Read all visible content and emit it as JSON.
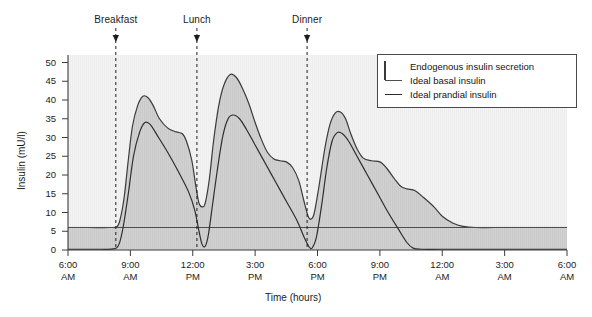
{
  "chart_data": {
    "type": "area",
    "title": "",
    "xlabel": "Time (hours)",
    "ylabel": "Insulin (mU/l)",
    "ylim": [
      0,
      52
    ],
    "yticks": [
      0,
      5,
      10,
      15,
      20,
      25,
      30,
      35,
      40,
      45,
      50
    ],
    "xlim_hours": [
      6,
      30
    ],
    "grid": false,
    "legend_position": "top-right",
    "xticks": [
      {
        "hour": 6,
        "time": "6:00",
        "ampm": "AM"
      },
      {
        "hour": 9,
        "time": "9:00",
        "ampm": "AM"
      },
      {
        "hour": 12,
        "time": "12:00",
        "ampm": "PM"
      },
      {
        "hour": 15,
        "time": "3:00",
        "ampm": "PM"
      },
      {
        "hour": 18,
        "time": "6:00",
        "ampm": "PM"
      },
      {
        "hour": 21,
        "time": "9:00",
        "ampm": "PM"
      },
      {
        "hour": 24,
        "time": "12:00",
        "ampm": "AM"
      },
      {
        "hour": 27,
        "time": "3:00",
        "ampm": "AM"
      },
      {
        "hour": 30,
        "time": "6:00",
        "ampm": "AM"
      }
    ],
    "annotations": [
      {
        "label": "Breakfast",
        "hour": 8.3
      },
      {
        "label": "Lunch",
        "hour": 12.2
      },
      {
        "label": "Dinner",
        "hour": 17.5
      }
    ],
    "series": [
      {
        "name": "Endogenous insulin secretion",
        "kind": "area",
        "fill_color": "#d2d2d2",
        "line_color": "#3a3a3a",
        "points": [
          [
            6.0,
            6.0
          ],
          [
            7.0,
            6.0
          ],
          [
            8.0,
            6.0
          ],
          [
            8.35,
            6.2
          ],
          [
            8.5,
            8.0
          ],
          [
            8.7,
            14.0
          ],
          [
            8.9,
            24.0
          ],
          [
            9.1,
            33.0
          ],
          [
            9.35,
            38.5
          ],
          [
            9.6,
            41.0
          ],
          [
            9.85,
            40.6
          ],
          [
            10.1,
            38.5
          ],
          [
            10.4,
            35.0
          ],
          [
            10.8,
            32.5
          ],
          [
            11.2,
            31.5
          ],
          [
            11.5,
            31.0
          ],
          [
            11.7,
            29.0
          ],
          [
            11.95,
            24.0
          ],
          [
            12.15,
            17.0
          ],
          [
            12.3,
            12.5
          ],
          [
            12.45,
            11.5
          ],
          [
            12.6,
            12.5
          ],
          [
            12.8,
            19.0
          ],
          [
            13.0,
            29.0
          ],
          [
            13.25,
            38.5
          ],
          [
            13.5,
            44.0
          ],
          [
            13.8,
            46.8
          ],
          [
            14.1,
            46.0
          ],
          [
            14.4,
            43.0
          ],
          [
            14.7,
            39.0
          ],
          [
            15.0,
            34.0
          ],
          [
            15.3,
            29.5
          ],
          [
            15.6,
            26.0
          ],
          [
            15.9,
            24.3
          ],
          [
            16.2,
            23.8
          ],
          [
            16.5,
            23.5
          ],
          [
            16.8,
            22.0
          ],
          [
            17.1,
            18.5
          ],
          [
            17.35,
            13.0
          ],
          [
            17.55,
            9.0
          ],
          [
            17.7,
            8.3
          ],
          [
            17.85,
            10.0
          ],
          [
            18.1,
            18.0
          ],
          [
            18.35,
            27.0
          ],
          [
            18.6,
            33.5
          ],
          [
            18.85,
            36.5
          ],
          [
            19.1,
            36.8
          ],
          [
            19.35,
            35.0
          ],
          [
            19.6,
            31.0
          ],
          [
            19.9,
            27.0
          ],
          [
            20.2,
            24.5
          ],
          [
            20.6,
            23.8
          ],
          [
            21.0,
            23.5
          ],
          [
            21.3,
            22.0
          ],
          [
            21.7,
            19.0
          ],
          [
            22.0,
            17.0
          ],
          [
            22.3,
            16.3
          ],
          [
            22.7,
            15.8
          ],
          [
            23.1,
            14.0
          ],
          [
            23.6,
            11.5
          ],
          [
            24.0,
            9.0
          ],
          [
            24.5,
            7.2
          ],
          [
            25.0,
            6.3
          ],
          [
            25.6,
            6.0
          ],
          [
            26.5,
            6.0
          ],
          [
            28.0,
            6.0
          ],
          [
            30.0,
            6.0
          ]
        ]
      },
      {
        "name": "Ideal basal insulin",
        "kind": "line",
        "line_color": "#4d4d4d",
        "level": 6.0,
        "points": [
          [
            6.0,
            6.0
          ],
          [
            30.0,
            6.0
          ]
        ]
      },
      {
        "name": "Ideal prandial insulin",
        "kind": "line",
        "line_color": "#2e2e2e",
        "points": [
          [
            6.0,
            0.2
          ],
          [
            7.5,
            0.2
          ],
          [
            8.2,
            0.3
          ],
          [
            8.45,
            1.5
          ],
          [
            8.65,
            6.0
          ],
          [
            8.9,
            15.0
          ],
          [
            9.15,
            25.0
          ],
          [
            9.45,
            31.5
          ],
          [
            9.7,
            34.0
          ],
          [
            9.95,
            33.5
          ],
          [
            10.3,
            30.5
          ],
          [
            10.8,
            26.0
          ],
          [
            11.3,
            21.0
          ],
          [
            11.8,
            15.5
          ],
          [
            12.1,
            10.5
          ],
          [
            12.3,
            5.0
          ],
          [
            12.45,
            1.5
          ],
          [
            12.6,
            1.0
          ],
          [
            12.75,
            4.0
          ],
          [
            12.95,
            12.0
          ],
          [
            13.2,
            22.0
          ],
          [
            13.45,
            30.5
          ],
          [
            13.7,
            35.0
          ],
          [
            13.95,
            36.0
          ],
          [
            14.25,
            35.0
          ],
          [
            14.6,
            32.0
          ],
          [
            15.0,
            28.0
          ],
          [
            15.5,
            23.0
          ],
          [
            16.0,
            18.0
          ],
          [
            16.5,
            13.0
          ],
          [
            17.0,
            8.0
          ],
          [
            17.35,
            3.5
          ],
          [
            17.6,
            0.8
          ],
          [
            17.75,
            0.6
          ],
          [
            17.95,
            3.5
          ],
          [
            18.2,
            12.0
          ],
          [
            18.45,
            22.0
          ],
          [
            18.7,
            29.0
          ],
          [
            18.95,
            31.3
          ],
          [
            19.2,
            31.0
          ],
          [
            19.5,
            29.0
          ],
          [
            19.9,
            25.0
          ],
          [
            20.4,
            20.0
          ],
          [
            20.9,
            15.0
          ],
          [
            21.4,
            10.0
          ],
          [
            21.9,
            5.5
          ],
          [
            22.3,
            2.0
          ],
          [
            22.6,
            0.5
          ],
          [
            23.0,
            0.2
          ],
          [
            24.0,
            0.2
          ],
          [
            26.0,
            0.2
          ],
          [
            30.0,
            0.2
          ]
        ]
      }
    ]
  },
  "legend": {
    "items": [
      {
        "label": "Endogenous insulin secretion",
        "key": "swatch"
      },
      {
        "label": "Ideal basal insulin",
        "key": "line-thin"
      },
      {
        "label": "Ideal prandial insulin",
        "key": "line-thick"
      }
    ]
  },
  "colors": {
    "area_fill": "#d2d2d2",
    "basal_band": "#cfcfcf",
    "axis": "#3c3c3c",
    "plot_bg": "#f4f4f4",
    "text": "#1a1a1a"
  }
}
